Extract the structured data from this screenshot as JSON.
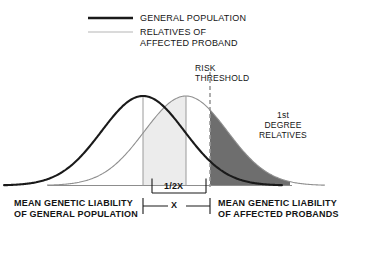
{
  "figure": {
    "title": "",
    "legend": [
      {
        "id": "general-population",
        "label": "GENERAL POPULATION",
        "line_style": "thick-solid",
        "color": "#1a1a1a"
      },
      {
        "id": "relatives-of-affected-proband",
        "label": "RELATIVES OF\nAFFECTED PROBAND",
        "line_style": "thin-solid",
        "color": "#b0b0b0"
      }
    ],
    "annotations": {
      "risk_threshold": "RISK\nTHRESHOLD",
      "first_degree_relatives": "1st\nDEGREE\nRELATIVES",
      "half_x": "1/2X",
      "x": "X"
    },
    "axis_labels": {
      "left": "MEAN GENETIC LIABILITY\nOF GENERAL POPULATION",
      "right": "MEAN GENETIC LIABILITY\nOF AFFECTED PROBANDS"
    },
    "colors": {
      "curve_general": "#1a1a1a",
      "curve_relatives": "#8f8f8f",
      "fill_light": "#ececec",
      "fill_dark": "#6e6e6e",
      "threshold_dash": "#9a9a9a",
      "baseline": "#8d8d8d"
    }
  },
  "chart_data": {
    "type": "line",
    "xlabel": "Genetic liability",
    "ylabel": "",
    "grid": false,
    "legend_position": "top-center",
    "x": [
      0,
      1,
      2,
      3,
      4,
      5,
      6,
      7,
      8,
      9,
      10
    ],
    "series": [
      {
        "name": "GENERAL POPULATION",
        "mean": 3.0,
        "sd": 1.45,
        "style": "thick-solid",
        "color": "#1a1a1a",
        "values": [
          0.07,
          0.25,
          0.62,
          1.0,
          0.62,
          0.25,
          0.07,
          0.01,
          0.0,
          0.0,
          0.0
        ]
      },
      {
        "name": "RELATIVES OF AFFECTED PROBAND",
        "mean": 4.5,
        "sd": 1.45,
        "style": "thin-solid",
        "color": "#8f8f8f",
        "values": [
          0.01,
          0.07,
          0.25,
          0.62,
          1.0,
          0.62,
          0.25,
          0.07,
          0.01,
          0.0,
          0.0
        ]
      }
    ],
    "markers": [
      {
        "name": "mean-general-population",
        "x": 3.0,
        "type": "vertical-line"
      },
      {
        "name": "mean-affected-probands-half",
        "x": 4.5,
        "type": "vertical-line"
      },
      {
        "name": "risk-threshold",
        "x": 5.15,
        "type": "dashed-vertical-line",
        "label": "RISK THRESHOLD"
      }
    ],
    "shaded_regions": [
      {
        "name": "half-x-interval",
        "from": 3.0,
        "to": 4.5,
        "fill": "#ececec",
        "label": "1/2X"
      },
      {
        "name": "1st-degree-relatives-tail",
        "from": 5.15,
        "to": 10.0,
        "fill": "#6e6e6e",
        "label": "1st DEGREE RELATIVES"
      }
    ],
    "measurements": [
      {
        "name": "half-x",
        "label": "1/2X",
        "from": 3.0,
        "to": 4.5
      },
      {
        "name": "x",
        "label": "X",
        "from": 3.0,
        "to": 5.15
      }
    ]
  }
}
